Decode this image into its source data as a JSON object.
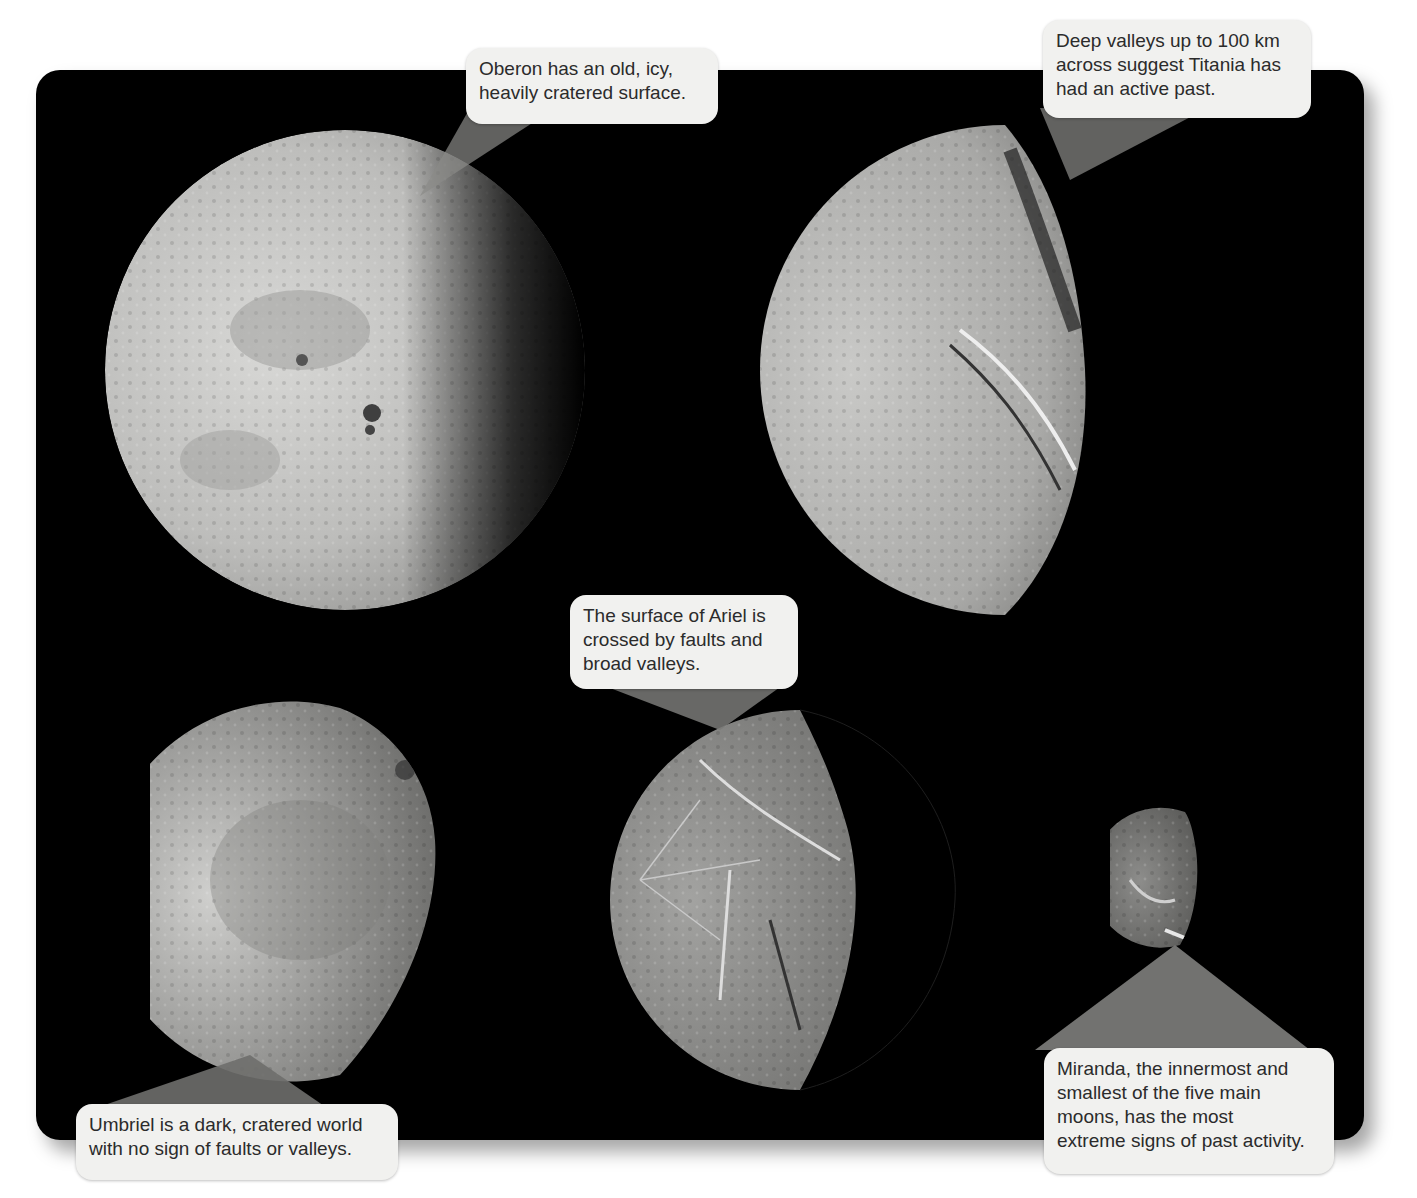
{
  "figure": {
    "colors": {
      "panel_background": "#000000",
      "callout_background": "#f1f1ef",
      "callout_text": "#2b2b2b",
      "pointer": "#7a7a7a"
    }
  },
  "moons": [
    {
      "name": "Oberon",
      "caption_lines": [
        "Oberon has an old, icy,",
        "heavily cratered surface."
      ]
    },
    {
      "name": "Titania",
      "caption_lines": [
        "Deep valleys up to 100 km",
        "across suggest Titania has",
        "had an active past."
      ]
    },
    {
      "name": "Ariel",
      "caption_lines": [
        "The surface of Ariel is",
        "crossed by faults and",
        "broad valleys."
      ]
    },
    {
      "name": "Umbriel",
      "caption_lines": [
        "Umbriel is a dark, cratered world",
        "with no sign of faults or valleys."
      ]
    },
    {
      "name": "Miranda",
      "caption_lines": [
        "Miranda, the innermost and",
        "smallest of the five main",
        "moons, has the most",
        "extreme signs of past activity."
      ]
    }
  ]
}
